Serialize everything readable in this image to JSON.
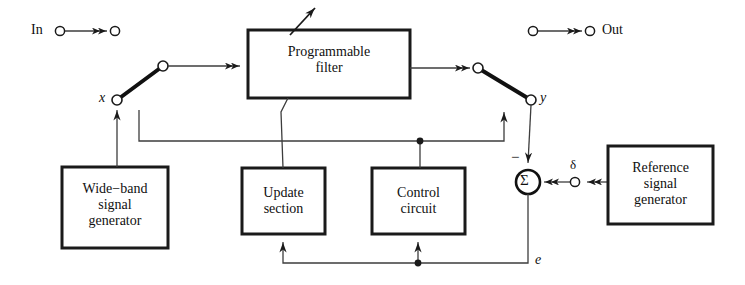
{
  "diagram": {
    "colors": {
      "stroke": "#1a1a1a",
      "thin_stroke": "#4a4a4a",
      "background": "#ffffff",
      "text": "#101010"
    },
    "terminals": [
      {
        "id": "in",
        "label": "In",
        "x": 60,
        "y": 31
      },
      {
        "id": "in_arrow_end",
        "label": "",
        "x": 115,
        "y": 31
      },
      {
        "id": "out_start",
        "label": "",
        "x": 533,
        "y": 31
      },
      {
        "id": "out",
        "label": "Out",
        "x": 590,
        "y": 31
      }
    ],
    "blocks": [
      {
        "id": "programmable-filter",
        "label": "Programmable\nfilter",
        "x": 248,
        "y": 30,
        "w": 162,
        "h": 68
      },
      {
        "id": "wide-band-signal-generator",
        "label": "Wide−band\nsignal\ngenerator",
        "x": 62,
        "y": 167,
        "w": 106,
        "h": 81
      },
      {
        "id": "update-section",
        "label": "Update\nsection",
        "x": 242,
        "y": 168,
        "w": 83,
        "h": 66
      },
      {
        "id": "control-circuit",
        "label": "Control\ncircuit",
        "x": 372,
        "y": 168,
        "w": 93,
        "h": 66
      },
      {
        "id": "reference-signal-generator",
        "label": "Reference\nsignal\ngenerator",
        "x": 608,
        "y": 146,
        "w": 105,
        "h": 78
      }
    ],
    "summing_junction": {
      "id": "summing-junction",
      "symbol": "Σ",
      "cx": 528,
      "cy": 182,
      "r": 12,
      "minus_sign": "−"
    },
    "node_labels": [
      {
        "id": "node-x",
        "text": "x",
        "x": 101,
        "y": 93
      },
      {
        "id": "node-y",
        "text": "y",
        "x": 541,
        "y": 93
      },
      {
        "id": "node-delta",
        "text": "δ",
        "x": 571,
        "y": 160
      },
      {
        "id": "node-e",
        "text": "e",
        "x": 536,
        "y": 254
      }
    ],
    "switches": [
      {
        "id": "input-switch",
        "pivot_x": 117,
        "pivot_y": 100,
        "blade_x": 163,
        "blade_y": 66
      },
      {
        "id": "output-switch",
        "pivot_x": 531,
        "pivot_y": 100,
        "blade_x": 478,
        "blade_y": 68
      }
    ],
    "junction_dots": [
      {
        "id": "junction-control-feed",
        "x": 420,
        "y": 141
      },
      {
        "id": "junction-error-feed",
        "x": 418,
        "y": 263
      }
    ]
  }
}
